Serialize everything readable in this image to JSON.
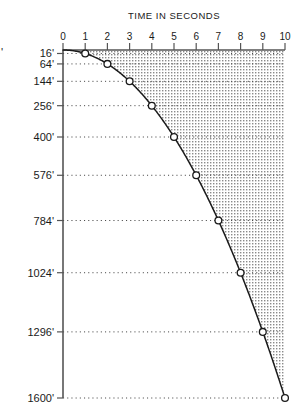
{
  "chart_data": {
    "type": "line",
    "title": "TIME IN SECONDS",
    "xlabel": "TIME IN SECONDS",
    "ylabel": "",
    "x": [
      0,
      1,
      2,
      3,
      4,
      5,
      6,
      7,
      8,
      9,
      10
    ],
    "values": [
      0,
      16,
      64,
      144,
      256,
      400,
      576,
      784,
      1024,
      1296,
      1600
    ],
    "xtick_labels": [
      "0",
      "1",
      "2",
      "3",
      "4",
      "5",
      "6",
      "7",
      "8",
      "9",
      "10"
    ],
    "ytick_values": [
      16,
      64,
      144,
      256,
      400,
      576,
      784,
      1024,
      1296,
      1600
    ],
    "ytick_labels": [
      "16'",
      "64'",
      "144'",
      "256'",
      "400'",
      "576'",
      "784'",
      "1024'",
      "1296'",
      "1600'"
    ],
    "xlim": [
      0,
      10
    ],
    "ylim": [
      0,
      1600
    ],
    "y_axis_inverted": true,
    "x_axis_position": "top",
    "grid": "horizontal-dotted",
    "legend": "none",
    "markers": "open-circle",
    "fill_region": "stipple-above-right-of-curve",
    "colors": {
      "curve": "#1a1a1a",
      "grid": "#4a4a4a",
      "axis": "#555555",
      "marker_fill": "#ffffff",
      "background": "#ffffff",
      "stipple": "#8a8a8a"
    },
    "annotations": [],
    "edge_marks": [
      "'"
    ]
  },
  "layout": {
    "plot_left": 63,
    "plot_right": 285,
    "plot_top": 50,
    "plot_bottom": 398
  }
}
